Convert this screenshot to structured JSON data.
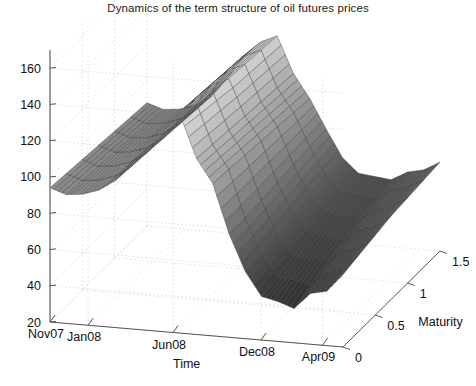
{
  "figure": {
    "title": "Dynamics of the term structure of oil futures prices",
    "background_color": "#ffffff",
    "grid": "on",
    "grid_color": "#d9d9d9",
    "axis_color": "#555555",
    "mesh_edge_color": "#2b2b2b"
  },
  "chart_data": {
    "type": "surface",
    "title": "Dynamics of the term structure of oil futures prices",
    "xlabel": "Time",
    "ylabel": "Maturity",
    "zlabel": "",
    "grid": "on",
    "legend": "none",
    "projection": {
      "kind": "matlab-3d",
      "azimuth_deg": -37.5,
      "elevation_deg": 30
    },
    "x_axis": {
      "name": "Time",
      "tick_labels": [
        "Nov07",
        "Jan08",
        "Jun08",
        "Dec08",
        "Apr09"
      ],
      "tick_positions": [
        0.0,
        0.13,
        0.42,
        0.72,
        0.93
      ],
      "range": [
        0,
        1
      ]
    },
    "y_axis": {
      "name": "Maturity",
      "tick_labels": [
        "0",
        "0.5",
        "1",
        "1.5"
      ],
      "tick_values": [
        0,
        0.5,
        1,
        1.5
      ],
      "range": [
        0,
        1.5
      ]
    },
    "z_axis": {
      "name": "",
      "tick_labels": [
        "20",
        "40",
        "60",
        "80",
        "100",
        "120",
        "140",
        "160"
      ],
      "tick_values": [
        20,
        40,
        60,
        80,
        100,
        120,
        140,
        160
      ],
      "range": [
        20,
        170
      ]
    },
    "maturities": [
      0,
      0.25,
      0.5,
      0.75,
      1.0,
      1.25,
      1.5
    ],
    "times": [
      "Nov07",
      "Dec07",
      "Jan08",
      "Feb08",
      "Mar08",
      "Apr08",
      "May08",
      "Jun08",
      "Jul08",
      "Aug08",
      "Sep08",
      "Oct08",
      "Nov08",
      "Dec08",
      "Jan09",
      "Feb09",
      "Mar09",
      "Apr09",
      "May09"
    ],
    "series": [
      {
        "name": "m=0.00",
        "values": [
          94,
          91,
          92,
          95,
          101,
          112,
          125,
          133,
          140,
          117,
          104,
          77,
          57,
          44,
          42,
          39,
          48,
          50,
          60
        ]
      },
      {
        "name": "m=0.25",
        "values": [
          93,
          90,
          91,
          94,
          100,
          111,
          124,
          132,
          138,
          116,
          103,
          77,
          58,
          46,
          45,
          43,
          51,
          53,
          62
        ]
      },
      {
        "name": "m=0.50",
        "values": [
          92,
          89,
          90,
          93,
          99,
          110,
          123,
          131,
          136,
          115,
          102,
          78,
          60,
          49,
          48,
          47,
          54,
          56,
          64
        ]
      },
      {
        "name": "m=0.75",
        "values": [
          91,
          88,
          89,
          92,
          98,
          109,
          122,
          130,
          134,
          114,
          101,
          79,
          62,
          52,
          51,
          50,
          57,
          59,
          66
        ]
      },
      {
        "name": "m=1.00",
        "values": [
          90,
          87,
          88,
          91,
          97,
          108,
          121,
          129,
          133,
          113,
          100,
          80,
          64,
          55,
          54,
          53,
          59,
          61,
          67
        ]
      },
      {
        "name": "m=1.25",
        "values": [
          89,
          86,
          87,
          90,
          96,
          107,
          120,
          128,
          132,
          112,
          99,
          81,
          66,
          57,
          56,
          55,
          61,
          63,
          68
        ]
      },
      {
        "name": "m=1.50",
        "values": [
          88,
          85,
          86,
          89,
          95,
          106,
          119,
          127,
          131,
          111,
          98,
          82,
          67,
          59,
          58,
          57,
          62,
          64,
          69
        ]
      }
    ],
    "annotations": []
  }
}
